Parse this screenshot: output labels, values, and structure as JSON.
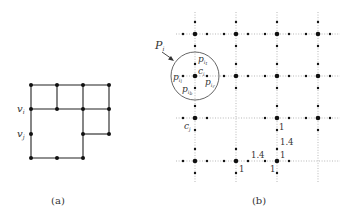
{
  "figure_a": {
    "caption": "(a)",
    "labels": {
      "vi": "v",
      "vi_sub": "i",
      "vj": "v",
      "vj_sub": "j"
    },
    "nodes": [
      [
        31,
        85
      ],
      [
        57,
        85
      ],
      [
        83,
        85
      ],
      [
        109,
        85
      ],
      [
        31,
        109
      ],
      [
        57,
        109
      ],
      [
        83,
        109
      ],
      [
        109,
        109
      ],
      [
        31,
        134
      ],
      [
        83,
        134
      ],
      [
        109,
        134
      ],
      [
        31,
        158
      ],
      [
        57,
        158
      ],
      [
        83,
        158
      ]
    ],
    "edges": [
      [
        31,
        85,
        109,
        85
      ],
      [
        31,
        85,
        31,
        158
      ],
      [
        57,
        85,
        57,
        109
      ],
      [
        31,
        109,
        109,
        109
      ],
      [
        83,
        85,
        83,
        158
      ],
      [
        109,
        85,
        109,
        134
      ],
      [
        83,
        134,
        109,
        134
      ],
      [
        31,
        158,
        83,
        158
      ]
    ]
  },
  "figure_b": {
    "caption": "(b)",
    "labels": {
      "P": "P",
      "P_sub": "i",
      "c_i": "c",
      "c_i_sub": "i",
      "c_j": "c",
      "c_j_sub": "j",
      "p_it": "p",
      "p_it_sub": "i",
      "p_it_sub2": "t",
      "p_il": "p",
      "p_il_sub": "i",
      "p_il_sub2": "l",
      "p_ir": "p",
      "p_ir_sub": "i",
      "p_ir_sub2": "r",
      "p_ib": "p",
      "p_ib_sub": "i",
      "p_ib_sub2": "b"
    },
    "weights": [
      "1",
      "1.4",
      "1",
      "1.4",
      "1",
      "1"
    ],
    "grid_x": [
      195,
      236,
      277,
      318
    ],
    "grid_y": [
      34,
      76,
      118,
      161
    ]
  }
}
